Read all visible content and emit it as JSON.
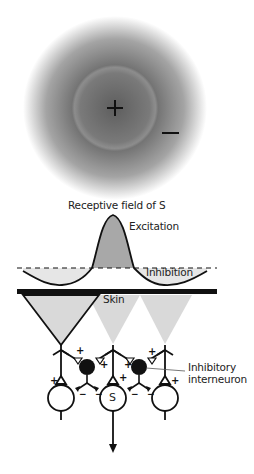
{
  "figure": {
    "receptive_field": {
      "center_sign": "+",
      "surround_sign": "−",
      "caption": "Receptive field of S"
    },
    "profile": {
      "excitation_label": "Excitation",
      "inhibition_label": "Inhibition"
    },
    "skin_label": "Skin",
    "circuit": {
      "central_neuron_label": "S",
      "interneuron_label_line1": "Inhibitory",
      "interneuron_label_line2": "interneuron",
      "excitatory_sign": "+",
      "inhibitory_sign": "−"
    },
    "colors": {
      "field_dark": "#6b6b6b",
      "field_light": "#d8d8d8",
      "excitation_fill": "#a8a8a8",
      "inhibition_fill": "#e6e6e6",
      "cone_fill": "#d9d9d9",
      "ink": "#111111"
    }
  }
}
